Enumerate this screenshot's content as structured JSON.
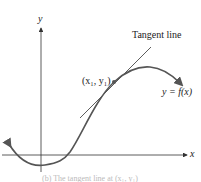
{
  "diagram": {
    "axes": {
      "x_label": "x",
      "y_label": "y"
    },
    "labels": {
      "tangent": "Tangent line",
      "point": "(x₁, y₁)",
      "function": "y = f(x)"
    },
    "caption": "(b) The tangent line at (x₁, y₁)",
    "colors": {
      "curve": "#555555",
      "axis": "#333333",
      "tangent": "#333333",
      "text": "#222222"
    }
  }
}
